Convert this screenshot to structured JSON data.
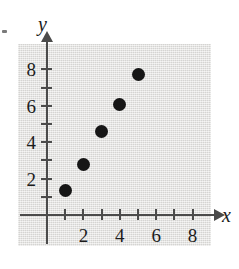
{
  "chart_data": {
    "type": "scatter",
    "title": "",
    "subtitle": "",
    "xlabel": "x",
    "ylabel": "y",
    "xlim": [
      0,
      9
    ],
    "ylim": [
      0,
      8.8
    ],
    "grid": false,
    "legend": null,
    "x_ticks_major": [
      2,
      4,
      6,
      8
    ],
    "y_ticks_major": [
      2,
      4,
      6,
      8
    ],
    "x_tick_values": [
      1,
      2,
      3,
      4,
      5,
      6,
      7,
      8
    ],
    "y_tick_values": [
      1,
      2,
      3,
      4,
      5,
      6,
      7,
      8
    ],
    "x_tick_labels": [
      "2",
      "4",
      "6",
      "8"
    ],
    "y_tick_labels": [
      "2",
      "4",
      "6",
      "8"
    ],
    "point_color": "#161616",
    "panel_color": "#e3e2e0",
    "axis_color": "#4b4b4b",
    "points": [
      {
        "x": 1,
        "y": 1.35
      },
      {
        "x": 2,
        "y": 2.8
      },
      {
        "x": 3,
        "y": 4.6
      },
      {
        "x": 4,
        "y": 6.05
      },
      {
        "x": 5,
        "y": 7.7
      }
    ],
    "x": [
      1,
      2,
      3,
      4,
      5
    ],
    "values": [
      1.35,
      2.8,
      4.6,
      6.05,
      7.7
    ]
  },
  "geometry": {
    "origin_x_px": 47,
    "origin_y_px": 215,
    "unit_px": 18.2
  }
}
